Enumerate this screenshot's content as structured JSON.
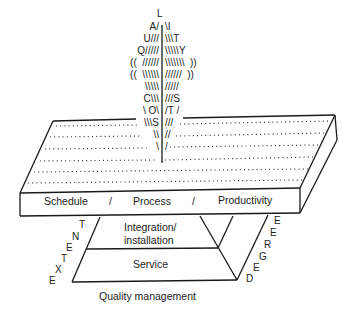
{
  "diagram": {
    "slab_front_labels": [
      "Schedule",
      "/",
      "Process",
      "/",
      "Productivity"
    ],
    "pyramid_layers": {
      "top": "Integration/",
      "top_line2": "installation",
      "middle": "Service",
      "base_caption": "Quality management"
    },
    "left_diagonal_word": "EXTENT",
    "left_diagonal_letters": [
      "T",
      "N",
      "E",
      "T",
      "X",
      "E"
    ],
    "right_diagonal_word": "DEGREE",
    "right_diagonal_letters": [
      "E",
      "E",
      "R",
      "G",
      "E",
      "D"
    ],
    "rays": {
      "top_letter": "L",
      "rows": [
        {
          "left": "A/",
          "right": "\\I"
        },
        {
          "left": "U///",
          "right": "\\\\\\T"
        },
        {
          "left": "Q/////",
          "right": "\\\\\\\\\\Y"
        },
        {
          "left": "((  //////",
          "right": "\\\\\\\\\\\\\\  ))"
        },
        {
          "left": "((  \\\\\\\\\\\\",
          "right": "//////  ))"
        },
        {
          "left": "\\\\\\\\\\",
          "right": "/////"
        },
        {
          "left": "C\\\\\\",
          "right": "///S"
        },
        {
          "left": "\\ O\\",
          "right": "/T /"
        },
        {
          "left": "\\\\\\S",
          "right": "///"
        },
        {
          "left": "\\\\",
          "right": "//"
        },
        {
          "left": "\\",
          "right": "/"
        }
      ],
      "vertical_word": "QUALITY",
      "cost_word": "COST",
      "center_letters": [
        "L",
        "A",
        "U",
        "Q",
        "I",
        "T",
        "Y",
        "C",
        "O",
        "S",
        "T",
        "S"
      ]
    },
    "dot_rows": 6,
    "line_color": "#1a1a1a",
    "background": "#ffffff"
  }
}
